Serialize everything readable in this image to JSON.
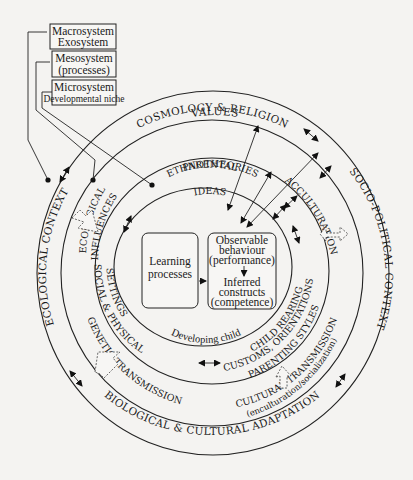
{
  "diagram": {
    "type": "nested-circles-framework",
    "colors": {
      "ink": "#222222",
      "background": "#f4f3f1"
    },
    "legend_boxes": [
      {
        "lines": [
          "Macrosystem",
          "Exosystem"
        ]
      },
      {
        "lines": [
          "Mesosystem",
          "(processes)"
        ]
      },
      {
        "lines": [
          "Microsystem",
          "Developmental niche"
        ]
      }
    ],
    "rings": {
      "outer": {
        "top_label": "COSMOLOGY & RELIGION",
        "top_sublabel": "VALUES",
        "left_label": "ECOLOGICAL CONTEXT",
        "right_label": "SOCIO-POLITICAL CONTEXT",
        "bottom_label": "BIOLOGICAL & CULTURAL ADAPTATION"
      },
      "second": {
        "left_label_line1": "ECOLOGICAL",
        "left_label_line2": "INFLUENCES",
        "right_label": "ACCULTURATION",
        "bottom_left_label": "GENETIC TRANSMISSION",
        "bottom_right_label": "CULTURAL TRANSMISSION",
        "bottom_right_sublabel": "(enculturation/socialization)"
      },
      "third": {
        "top_label_line1": "PARENTAL",
        "top_label_line2": "ETHNOTHEORIES",
        "top_label_line3": "IDEAS",
        "left_label_line1": "SOCIAL & PHYSICAL",
        "left_label_line2": "SETTINGS",
        "right_label_line1": "CHILD REARING",
        "right_label_line2": "CUSTOMS, ORIENTATIONS",
        "right_label_line3": "PARENTING STYLES"
      },
      "inner": {
        "bottom_label": "Developing child"
      }
    },
    "center": {
      "left_box": {
        "lines": [
          "Learning",
          "processes"
        ]
      },
      "right_box": {
        "top_lines": [
          "Observable",
          "behaviour",
          "(performance)"
        ],
        "bottom_lines": [
          "Inferred",
          "constructs",
          "(competence)"
        ]
      }
    }
  }
}
